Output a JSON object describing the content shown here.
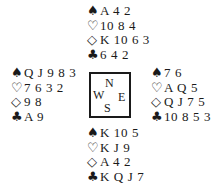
{
  "diagram": {
    "type": "bridge-deal",
    "suit_symbols": {
      "spades": "♠",
      "hearts": "♡",
      "diamonds": "◇",
      "clubs": "♣"
    },
    "compass": {
      "north": "N",
      "west": "W",
      "east": "E",
      "south": "S"
    },
    "hands": {
      "north": {
        "spades": "A 4 2",
        "hearts": "10 8 4",
        "diamonds": "K 10 6 3",
        "clubs": "6 4 2"
      },
      "west": {
        "spades": "Q J 9 8 3",
        "hearts": "7 6 3 2",
        "diamonds": "9 8",
        "clubs": "A 9"
      },
      "east": {
        "spades": "7 6",
        "hearts": "A Q 5",
        "diamonds": "Q J 7 5",
        "clubs": "10 8 5 3"
      },
      "south": {
        "spades": "K 10 5",
        "hearts": "K J 9",
        "diamonds": "A 4 2",
        "clubs": "K Q J 7"
      }
    }
  }
}
